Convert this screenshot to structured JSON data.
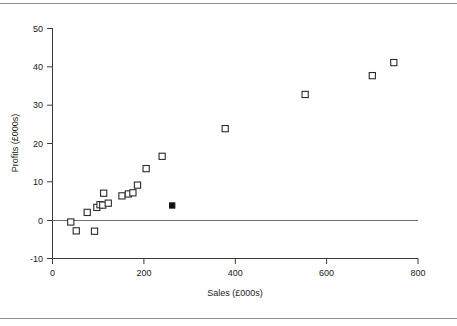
{
  "figure": {
    "rule_top": "horizontal-rule",
    "rule_bottom": "horizontal-rule"
  },
  "chart_data": {
    "type": "scatter",
    "title": "",
    "xlabel": "Sales (£000s)",
    "ylabel": "Profits (£000s)",
    "xlim": [
      0,
      800
    ],
    "ylim": [
      -10,
      50
    ],
    "xticks": [
      0,
      200,
      400,
      600,
      800
    ],
    "yticks": [
      -10,
      0,
      10,
      20,
      30,
      40,
      50
    ],
    "xtick_labels": [
      "0",
      "200",
      "400",
      "600",
      "800"
    ],
    "ytick_labels": [
      "-10",
      "0",
      "10",
      "20",
      "30",
      "40",
      "50"
    ],
    "grid": false,
    "legend": null,
    "reference_lines": [
      {
        "name": "zero-profit-line",
        "orientation": "horizontal",
        "y": 0
      }
    ],
    "series": [
      {
        "name": "Companies",
        "marker": "open-square",
        "color": "#2b2b2b",
        "points": [
          {
            "x": 40,
            "y": -0.5
          },
          {
            "x": 52,
            "y": -2.8
          },
          {
            "x": 76,
            "y": 2.0
          },
          {
            "x": 92,
            "y": -2.9
          },
          {
            "x": 97,
            "y": 3.3
          },
          {
            "x": 104,
            "y": 4.0
          },
          {
            "x": 110,
            "y": 3.9
          },
          {
            "x": 112,
            "y": 7.0
          },
          {
            "x": 122,
            "y": 4.4
          },
          {
            "x": 152,
            "y": 6.3
          },
          {
            "x": 166,
            "y": 6.8
          },
          {
            "x": 176,
            "y": 7.1
          },
          {
            "x": 186,
            "y": 9.1
          },
          {
            "x": 205,
            "y": 13.4
          },
          {
            "x": 240,
            "y": 16.6
          },
          {
            "x": 378,
            "y": 23.8
          },
          {
            "x": 553,
            "y": 32.7
          },
          {
            "x": 700,
            "y": 37.6
          },
          {
            "x": 747,
            "y": 41.0
          }
        ]
      },
      {
        "name": "Highlighted company",
        "marker": "filled-square",
        "color": "#111111",
        "points": [
          {
            "x": 262,
            "y": 3.8
          }
        ]
      }
    ]
  }
}
